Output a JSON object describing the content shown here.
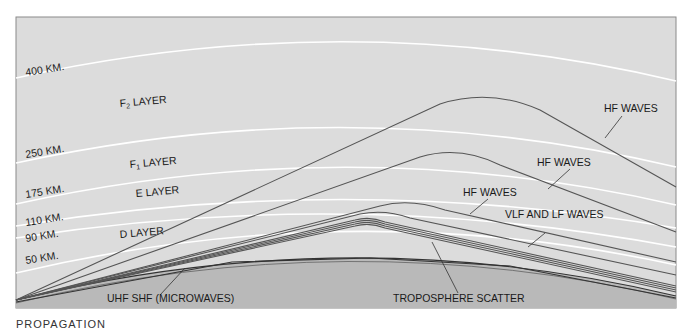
{
  "colors": {
    "sky": "#dcdcdc",
    "earth": "#b9b9b9",
    "boundary": "#ffffff",
    "ray": "#555555",
    "frame": "#8a8a8a"
  },
  "altitudes": [
    {
      "label": "400 KM.",
      "km": 400
    },
    {
      "label": "250 KM.",
      "km": 250
    },
    {
      "label": "175 KM.",
      "km": 175
    },
    {
      "label": "110 KM.",
      "km": 110
    },
    {
      "label": "90 KM.",
      "km": 90
    },
    {
      "label": "50 KM.",
      "km": 50
    }
  ],
  "layers": [
    {
      "name": "F2 LAYER",
      "main": "F",
      "sub": "2",
      "rest": " LAYER"
    },
    {
      "name": "F1 LAYER",
      "main": "F",
      "sub": "1",
      "rest": " LAYER"
    },
    {
      "name": "E LAYER",
      "main": "E LAYER",
      "sub": "",
      "rest": ""
    },
    {
      "name": "D LAYER",
      "main": "D LAYER",
      "sub": "",
      "rest": ""
    }
  ],
  "wave_labels": {
    "hf_f2": "HF WAVES",
    "hf_f1": "HF WAVES",
    "hf_e": "HF WAVES",
    "vlf_lf": "VLF AND LF WAVES",
    "uhf_shf": "UHF SHF (MICROWAVES)",
    "troposphere": "TROPOSPHERE SCATTER"
  },
  "caption": "PROPAGATION"
}
